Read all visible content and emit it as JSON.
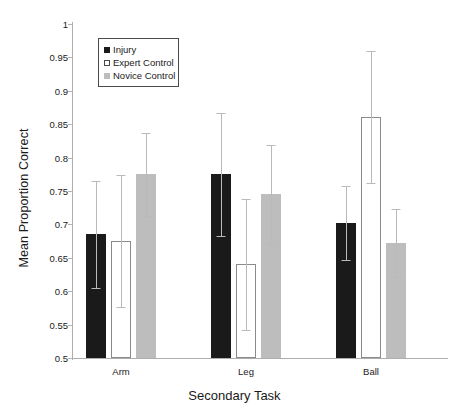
{
  "chart_data": {
    "type": "bar",
    "title": "",
    "xlabel": "Secondary Task",
    "ylabel": "Mean Proportion Correct",
    "categories": [
      "Arm",
      "Leg",
      "Ball"
    ],
    "ylim": [
      0.5,
      1
    ],
    "ytick_labels": [
      "0.5",
      "0.55",
      "0.6",
      "0.65",
      "0.7",
      "0.75",
      "0.8",
      "0.85",
      "0.9",
      "0.95",
      "1"
    ],
    "ytick_values": [
      0.5,
      0.55,
      0.6,
      0.65,
      0.7,
      0.75,
      0.8,
      0.85,
      0.9,
      0.95,
      1
    ],
    "grid": false,
    "legend_position": "top-left",
    "series": [
      {
        "name": "Injury",
        "color": "#1a1a1a",
        "values": [
          0.685,
          0.775,
          0.702
        ],
        "errors_upper": [
          0.765,
          0.867,
          0.757
        ],
        "errors_lower": [
          0.605,
          0.683,
          0.647
        ]
      },
      {
        "name": "Expert Control",
        "color": "#ffffff",
        "values": [
          0.675,
          0.64,
          0.861
        ],
        "errors_upper": [
          0.774,
          0.738,
          0.96
        ],
        "errors_lower": [
          0.576,
          0.542,
          0.762
        ]
      },
      {
        "name": "Novice Control",
        "color": "#bdbdbd",
        "values": [
          0.775,
          0.745,
          0.672
        ],
        "errors_upper": [
          0.837,
          0.819,
          0.723
        ],
        "errors_lower": [
          0.713,
          0.671,
          0.621
        ]
      }
    ]
  },
  "legend": {
    "items": [
      {
        "label": "Injury"
      },
      {
        "label": "Expert Control"
      },
      {
        "label": "Novice Control"
      }
    ]
  },
  "axes": {
    "y_title": "Mean Proportion Correct",
    "x_title": "Secondary Task"
  }
}
